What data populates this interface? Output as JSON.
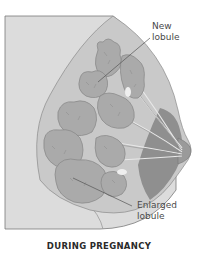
{
  "figure": {
    "caption": "DURING PREGNANCY",
    "labels": {
      "new_lobule": [
        "New",
        "lobule"
      ],
      "enlarged_lobule": [
        "Enlarged",
        "lobule"
      ]
    },
    "colors": {
      "background": "#ffffff",
      "chest_wall": "#dcdcdc",
      "breast_tissue": "#c8c8c8",
      "lobule_fill": "#a9a9a9",
      "lobule_stroke": "#8a8a8a",
      "dark_region": "#8c8c8c",
      "frame_stroke": "#7a7a7a",
      "leader_line": "#555555",
      "label_text": "#4a4a4a",
      "caption_text": "#2a2a2a"
    }
  }
}
